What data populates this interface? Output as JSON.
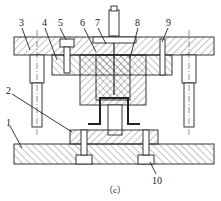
{
  "diagram": {
    "type": "die-assembly-section",
    "caption": "（c）",
    "labels": [
      {
        "id": "1",
        "text": "1",
        "x": 6,
        "y": 118
      },
      {
        "id": "2",
        "text": "2",
        "x": 6,
        "y": 86
      },
      {
        "id": "3",
        "text": "3",
        "x": 19,
        "y": 18
      },
      {
        "id": "4",
        "text": "4",
        "x": 42,
        "y": 18
      },
      {
        "id": "5",
        "text": "5",
        "x": 58,
        "y": 18
      },
      {
        "id": "6",
        "text": "6",
        "x": 80,
        "y": 18
      },
      {
        "id": "7",
        "text": "7",
        "x": 95,
        "y": 18
      },
      {
        "id": "8",
        "text": "8",
        "x": 135,
        "y": 18
      },
      {
        "id": "9",
        "text": "9",
        "x": 166,
        "y": 18
      },
      {
        "id": "10",
        "text": "10",
        "x": 152,
        "y": 176
      }
    ],
    "colors": {
      "line": "#222222",
      "background": "#ffffff"
    }
  }
}
